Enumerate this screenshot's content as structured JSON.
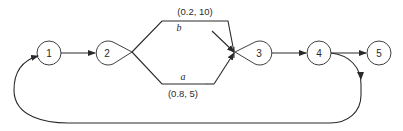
{
  "diagram": {
    "type": "activity-network",
    "colors": {
      "line": "#2a2a2a",
      "background": "#ffffff"
    },
    "nodes": [
      {
        "id": "1",
        "label": "1",
        "shape": "circle"
      },
      {
        "id": "2",
        "label": "2",
        "shape": "teardrop-branch"
      },
      {
        "id": "3",
        "label": "3",
        "shape": "teardrop-merge"
      },
      {
        "id": "4",
        "label": "4",
        "shape": "circle"
      },
      {
        "id": "5",
        "label": "5",
        "shape": "circle"
      }
    ],
    "edges": [
      {
        "from": "1",
        "to": "2"
      },
      {
        "from": "2",
        "to": "3",
        "name": "b",
        "params": "(0.2, 10)",
        "branch": "upper"
      },
      {
        "from": "2",
        "to": "3",
        "name": "a",
        "params": "(0.8, 5)",
        "branch": "lower"
      },
      {
        "from": "3",
        "to": "4"
      },
      {
        "from": "4",
        "to": "5"
      },
      {
        "from": "4",
        "to": "1",
        "type": "feedback-loop"
      }
    ]
  }
}
